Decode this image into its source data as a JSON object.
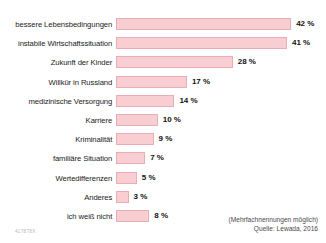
{
  "chart_data": {
    "type": "bar",
    "orientation": "horizontal",
    "title": "",
    "xlabel": "",
    "ylabel": "",
    "xlim": [
      0,
      42
    ],
    "grid": false,
    "legend": null,
    "unit": "%",
    "categories": [
      "bessere Lebensbedingungen",
      "instabile Wirtschaftssituation",
      "Zukunft der Kinder",
      "Willkür in Russland",
      "medizinische Versorgung",
      "Karriere",
      "Kriminalität",
      "familiäre Situation",
      "Wertedifferenzen",
      "Anderes",
      "ich weiß nicht"
    ],
    "values": [
      42,
      41,
      28,
      17,
      14,
      10,
      9,
      7,
      5,
      3,
      8
    ],
    "value_labels": [
      "42 %",
      "41 %",
      "28 %",
      "17 %",
      "14 %",
      "10 %",
      "9 %",
      "7 %",
      "5 %",
      "3 %",
      "8 %"
    ],
    "bar_color": "#f8ced3",
    "bar_border_color": "#e8aeb4"
  },
  "footer": {
    "note": "(Mehrfachnennungen möglich)",
    "source": "Quelle: Lewada, 2016"
  },
  "code": "417878X"
}
